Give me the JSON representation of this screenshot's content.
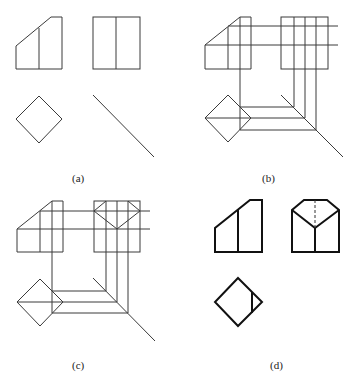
{
  "figure": {
    "panels": [
      {
        "id": "a",
        "label": "(a)",
        "description": "Given front view, side view, top view diamond and 45-degree miter line"
      },
      {
        "id": "b",
        "label": "(b)",
        "description": "Projection construction lines from front and side views through miter line"
      },
      {
        "id": "c",
        "label": "(c)",
        "description": "Constructing the cut-corner features in the side view"
      },
      {
        "id": "d",
        "label": "(d)",
        "description": "Completed three views with hidden line"
      }
    ]
  }
}
